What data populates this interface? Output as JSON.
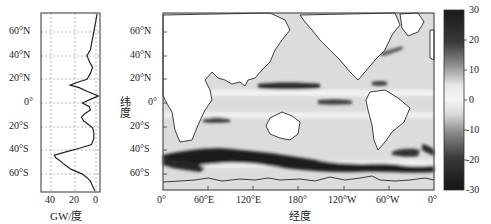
{
  "chart_data": [
    {
      "type": "line",
      "title": "",
      "xlabel": "GW/度",
      "ylabel": "",
      "x_ticks": [
        "40",
        "20",
        "0"
      ],
      "xlim": [
        48,
        -5
      ],
      "y_ticks": [
        "60°N",
        "40°N",
        "20°N",
        "0°",
        "20°S",
        "40°S",
        "60°S"
      ],
      "ylim": [
        -75,
        75
      ],
      "grid": true,
      "series": [
        {
          "name": "zonal integral",
          "lat": [
            75,
            70,
            60,
            50,
            45,
            40,
            35,
            30,
            25,
            20,
            18,
            15,
            13,
            10,
            6,
            3,
            0,
            -3,
            -6,
            -9,
            -12,
            -15,
            -18,
            -21,
            -25,
            -30,
            -35,
            -38,
            -41,
            -44,
            -46,
            -48,
            -52,
            -56,
            -60,
            -63,
            -66,
            -70,
            -74
          ],
          "value": [
            -1,
            0,
            2,
            4,
            5,
            8,
            6,
            3,
            5,
            8,
            15,
            23,
            15,
            8,
            -2,
            5,
            12,
            6,
            5,
            10,
            13,
            11,
            7,
            3,
            2,
            2,
            4,
            14,
            26,
            37,
            36,
            33,
            28,
            22,
            12,
            8,
            5,
            3,
            1
          ]
        }
      ]
    },
    {
      "type": "heatmap",
      "title": "",
      "xlabel": "经度",
      "ylabel": "纬度",
      "x_ticks": [
        "0°",
        "60°E",
        "120°E",
        "180°",
        "120°W",
        "60°W",
        "0°"
      ],
      "y_ticks": [
        "60°N",
        "40°N",
        "20°N",
        "0°",
        "20°S",
        "40°S",
        "60°S"
      ],
      "colorbar": {
        "ticks": [
          "30",
          "20",
          "10",
          "0",
          "-10",
          "-20",
          "-30"
        ],
        "range": [
          -30,
          30
        ]
      },
      "features": [
        "Strong dark band in Southern Ocean 40°S-60°S (values near -20 to -30)",
        "Dark zonal bands in tropical Pacific near 15°N and 5°S",
        "Dark patch in Indian Ocean near 15°S",
        "Dark patch in Caribbean near 15°N and Gulf Stream near 40°N",
        "Dark patch in South Atlantic off Argentina near 45°S"
      ]
    }
  ],
  "left_panel": {
    "xlabel": "GW/度",
    "x_ticks": [
      "40",
      "20",
      "0"
    ],
    "y_ticks": [
      "60°N",
      "40°N",
      "20°N",
      "0°",
      "20°S",
      "40°S",
      "60°S"
    ]
  },
  "map_panel": {
    "xlabel": "经度",
    "ylabel": "纬度",
    "x_ticks": [
      "0°",
      "60°E",
      "120°E",
      "180°",
      "120°W",
      "60°W",
      "0°"
    ],
    "y_ticks": [
      "60°N",
      "40°N",
      "20°N",
      "0°",
      "20°S",
      "40°S",
      "60°S"
    ]
  },
  "colorbar": {
    "ticks": [
      "30",
      "20",
      "10",
      "0",
      "-10",
      "-20",
      "-30"
    ]
  }
}
